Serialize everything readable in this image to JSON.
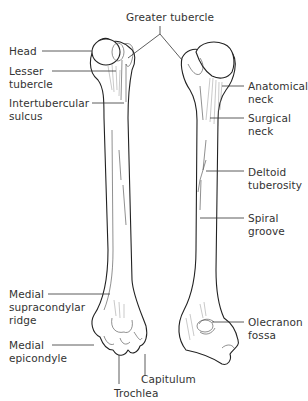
{
  "figure": {
    "views": [
      "anterior",
      "posterior"
    ]
  },
  "labels": {
    "greater_tubercle": "Greater tubercle",
    "head": "Head",
    "lesser_tubercle": "Lesser\ntubercle",
    "intertubercular_sulcus": "Intertubercular\nsulcus",
    "anatomical_neck": "Anatomical\nneck",
    "surgical_neck": "Surgical\nneck",
    "deltoid_tuberosity": "Deltoid\ntuberosity",
    "spiral_groove": "Spiral\ngroove",
    "medial_supracondylar_ridge": "Medial\nsupracondylar\nridge",
    "medial_epicondyle": "Medial\nepicondyle",
    "olecranon_fossa": "Olecranon\nfossa",
    "capitulum": "Capitulum",
    "trochlea": "Trochlea"
  }
}
